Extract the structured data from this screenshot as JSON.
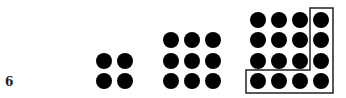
{
  "figure": {
    "label": "6",
    "dot_color": "#000000",
    "groups": [
      {
        "name": "group-2x2",
        "size": 2,
        "total": 4,
        "cols": [
          104,
          125
        ],
        "rows": [
          61,
          81
        ]
      },
      {
        "name": "group-3x3",
        "size": 3,
        "total": 9,
        "cols": [
          171,
          192,
          213
        ],
        "rows": [
          40,
          61,
          81
        ]
      },
      {
        "name": "group-4x4",
        "size": 4,
        "total": 16,
        "cols": [
          258,
          279,
          300,
          321
        ],
        "rows": [
          20,
          40,
          61,
          81
        ]
      }
    ],
    "outline": {
      "description": "L-shaped outline enclosing right column and bottom row of the 4x4 group",
      "vertical": {
        "left": 310,
        "top": 8,
        "width": 23,
        "height": 85
      },
      "horizontal": {
        "left": 246,
        "top": 70,
        "width": 87,
        "height": 23
      }
    }
  }
}
